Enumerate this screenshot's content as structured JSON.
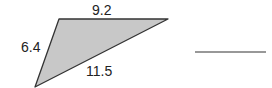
{
  "diagram": {
    "type": "triangle",
    "fill_color": "#c8c8c8",
    "stroke_color": "#333333",
    "vertices": {
      "top_left": [
        59,
        19
      ],
      "top_right": [
        168,
        19
      ],
      "bottom": [
        35,
        87
      ]
    },
    "sides": {
      "top": "9.2",
      "left": "6.4",
      "bottom": "11.5"
    },
    "answer_blank": {
      "x1": 195,
      "x2": 266,
      "y": 52
    }
  }
}
